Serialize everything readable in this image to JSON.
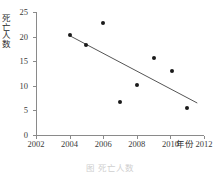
{
  "chart_data": {
    "type": "scatter",
    "title": "",
    "xlabel": "年份",
    "ylabel": "死亡人数",
    "xlim": [
      2002,
      2012
    ],
    "ylim": [
      0,
      25
    ],
    "grid": false,
    "legend": null,
    "x_ticks": [
      "2002",
      "2004",
      "2006",
      "2008",
      "2010",
      "2012"
    ],
    "x_tick_values": [
      2002,
      2004,
      2006,
      2008,
      2010,
      2012
    ],
    "y_ticks": [
      "0",
      "5",
      "10",
      "15",
      "20",
      "25"
    ],
    "y_tick_values": [
      0,
      5,
      10,
      15,
      20,
      25
    ],
    "x": [
      2004,
      2005,
      2006,
      2007,
      2008,
      2009,
      2010.1,
      2011
    ],
    "values": [
      20.3,
      18.3,
      22.7,
      6.8,
      10.2,
      15.6,
      13.1,
      5.5
    ],
    "series": [
      {
        "name": "死亡人数",
        "x": [
          2004,
          2005,
          2006,
          2007,
          2008,
          2009,
          2010.1,
          2011
        ],
        "values": [
          20.3,
          18.3,
          22.7,
          6.8,
          10.2,
          15.6,
          13.1,
          5.5
        ],
        "marker": "circle",
        "color": "#1a1a1a"
      }
    ],
    "trendline": {
      "type": "line",
      "x": [
        2004,
        2011.6
      ],
      "values": [
        20.2,
        6.5
      ],
      "color": "#555555"
    },
    "caption": "图    死亡人数"
  },
  "colors": {
    "axis": "#8a8a8a",
    "point": "#1a1a1a",
    "trend": "#555555",
    "text": "#3a3a3a",
    "background": "#ffffff"
  }
}
